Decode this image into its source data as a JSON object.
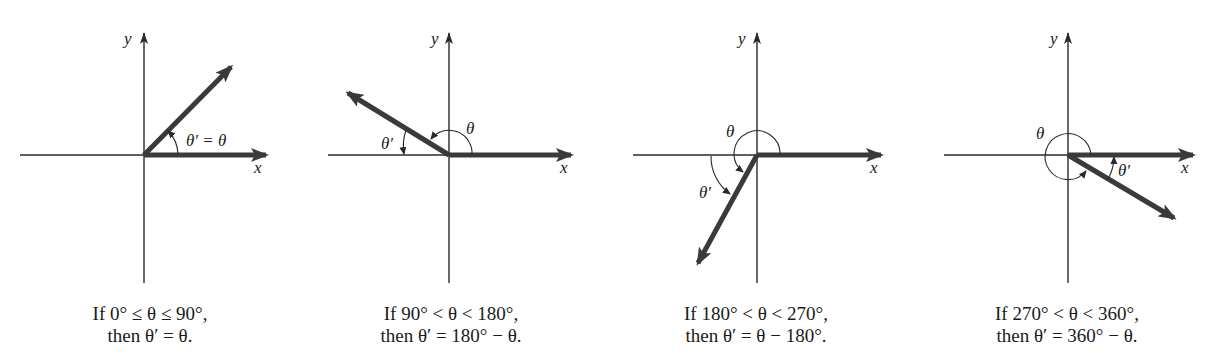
{
  "diagram": {
    "axis_labels": {
      "x": "x",
      "y": "y"
    },
    "panels": [
      {
        "quadrant": "I",
        "angle_label": "θ′ = θ",
        "theta_label": "θ",
        "theta_prime_label": "θ′",
        "caption_line1": "If 0° ≤ θ ≤ 90°,",
        "caption_line2": "then θ′ = θ."
      },
      {
        "quadrant": "II",
        "theta_label": "θ",
        "theta_prime_label": "θ′",
        "caption_line1": "If 90° < θ < 180°,",
        "caption_line2": "then θ′ = 180° − θ."
      },
      {
        "quadrant": "III",
        "theta_label": "θ",
        "theta_prime_label": "θ′",
        "caption_line1": "If 180° < θ < 270°,",
        "caption_line2": "then θ′ = θ − 180°."
      },
      {
        "quadrant": "IV",
        "theta_label": "θ",
        "theta_prime_label": "θ′",
        "caption_line1": "If 270° < θ < 360°,",
        "caption_line2": "then θ′ = 360° − θ."
      }
    ]
  },
  "colors": {
    "ray": "#3a3a3a",
    "axis": "#2a2a2a",
    "background": "#ffffff"
  }
}
